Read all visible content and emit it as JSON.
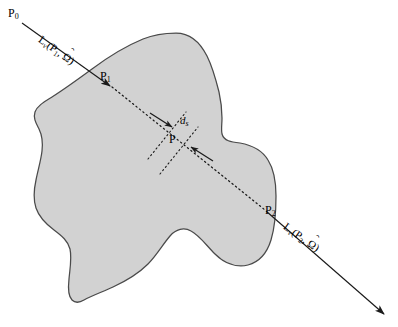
{
  "figure": {
    "background_color": "#ffffff",
    "medium_fill_color": "#d2d2d2",
    "medium_stroke_color": "#4a4a4a",
    "line_color": "#1a1a1a",
    "width": 398,
    "height": 327
  },
  "labels": {
    "p0": "P",
    "p0_sub": "0",
    "p1": "P",
    "p1_sub": "1",
    "p2": "P",
    "p2_sub": "2",
    "p": "P",
    "ds": "d",
    "ds_sub": "s",
    "radiance_in_L": "L",
    "radiance_in_v": "v",
    "radiance_in_open": "(P",
    "radiance_in_sub": "1",
    "radiance_in_comma": ", ",
    "radiance_in_omega": "Ω",
    "radiance_in_hat": "ˆ",
    "radiance_in_close": ")",
    "radiance_out_L": "L",
    "radiance_out_v": "v",
    "radiance_out_open": "(P",
    "radiance_out_sub": "2",
    "radiance_out_comma": ", ",
    "radiance_out_omega": "Ω",
    "radiance_out_hat": "ˆ",
    "radiance_out_close": ")"
  },
  "geometry": {
    "ray_entry_point": [
      112,
      87
    ],
    "ray_sample_point": [
      176,
      135
    ],
    "ray_exit_point": [
      265,
      210
    ],
    "ray_origin": [
      22,
      22
    ],
    "ray_terminus": [
      385,
      315
    ],
    "ray_angle_deg": 39
  }
}
